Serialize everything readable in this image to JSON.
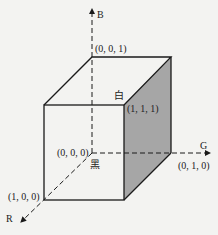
{
  "diagram": {
    "axes": {
      "b": {
        "label": "B"
      },
      "g": {
        "label": "G"
      },
      "r": {
        "label": "R"
      }
    },
    "vertices": {
      "origin": {
        "coord": "(0, 0, 0)",
        "name": "黑"
      },
      "blue": {
        "coord": "(0, 0, 1)"
      },
      "green": {
        "coord": "(0, 1, 0)"
      },
      "red": {
        "coord": "(1, 0, 0)"
      },
      "white": {
        "coord": "(1, 1, 1)",
        "name": "白"
      }
    },
    "colors": {
      "line": "#1a1a1a",
      "shaded_face": "#a6a6a6",
      "background": "#f3f3f1"
    }
  }
}
